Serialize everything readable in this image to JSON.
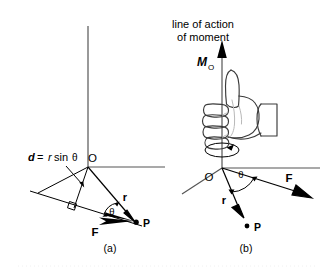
{
  "figure": {
    "background_color": "#ffffff",
    "ink_color": "#000000",
    "axis_color": "#555555",
    "hand_outline_color": "#3a3a3a",
    "panels": [
      {
        "id": "a",
        "caption": "(a)",
        "labels": {
          "origin": "O",
          "point": "P",
          "force": "F",
          "position_vector": "r",
          "angle": "θ",
          "moment_arm_prefix": "d",
          "moment_arm_equals": "=",
          "moment_arm_r": "r",
          "moment_arm_sin": "sin",
          "moment_arm_theta": "θ",
          "moment_arm_full": "d = r sin θ"
        }
      },
      {
        "id": "b",
        "caption": "(b)",
        "labels": {
          "title_line1": "line of action",
          "title_line2": "of moment",
          "moment_symbol": "M",
          "moment_subscript": "O",
          "moment_full": "M₀",
          "origin": "O",
          "point": "P",
          "force": "F",
          "position_vector": "r",
          "angle": "θ"
        }
      }
    ],
    "icons": [
      "arrow-up-icon",
      "rotation-ellipse-arrow-icon",
      "thumbs-up-hand-icon",
      "right-angle-marker-icon",
      "double-arrow-angle-arc-icon",
      "vector-arrowhead-icon"
    ]
  }
}
